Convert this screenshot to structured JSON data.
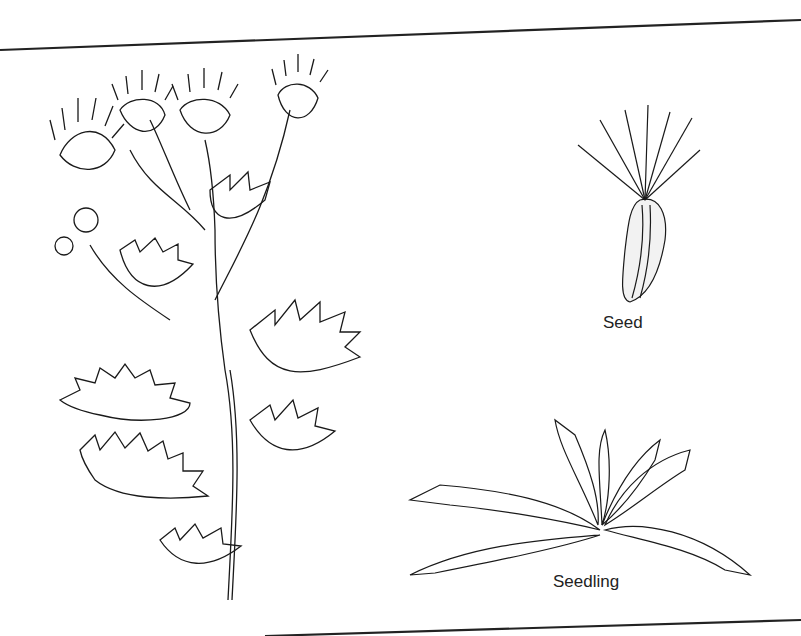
{
  "illustration": {
    "subject": "thistle plant botanical line drawing",
    "labels": {
      "seed": "Seed",
      "seedling": "Seedling"
    },
    "colors": {
      "ink": "#1a1a1a",
      "paper": "#ffffff"
    }
  }
}
